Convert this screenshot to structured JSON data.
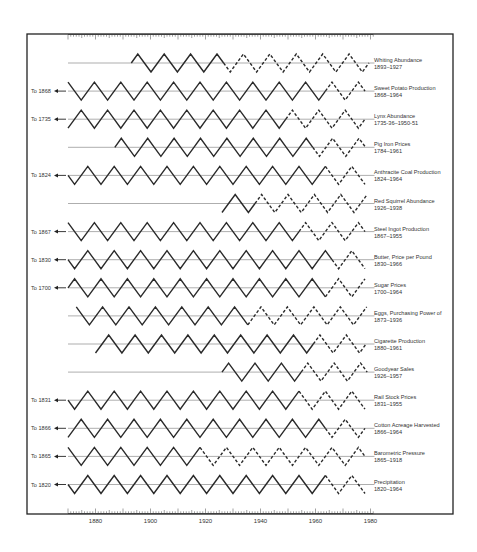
{
  "chart_data": {
    "type": "line",
    "title": "",
    "xlabel": "",
    "ylabel": "",
    "xlim": [
      1870,
      1981
    ],
    "x_ticks": [
      1880,
      1900,
      1920,
      1940,
      1960,
      1980
    ],
    "grid": false,
    "legend": "none (series labels at right of each row)",
    "style_note": "Idealized triangular cycles; solid = historical data, dashed = projected continuation",
    "series": [
      {
        "name": "Whiting Abundance",
        "range": "1893–1927",
        "left_note": "",
        "start": 1893,
        "end": 1927,
        "proj_end": 1980
      },
      {
        "name": "Sweet Potato Production",
        "range": "1868–1964",
        "left_note": "To 1868",
        "start": 1870,
        "end": 1964,
        "proj_end": 1980
      },
      {
        "name": "Lynx Abundance",
        "range": "1735-36–1950-51",
        "left_note": "To 1735",
        "start": 1870,
        "end": 1951,
        "proj_end": 1980
      },
      {
        "name": "Pig Iron Prices",
        "range": "1784–1961",
        "left_note": "",
        "start": 1887,
        "end": 1961,
        "proj_end": 1980
      },
      {
        "name": "Anthracite Coal Production",
        "range": "1824–1964",
        "left_note": "To 1824",
        "start": 1870,
        "end": 1964,
        "proj_end": 1980
      },
      {
        "name": "Red Squirrel Abundance",
        "range": "1926–1938",
        "left_note": "",
        "start": 1926,
        "end": 1938,
        "proj_end": 1980
      },
      {
        "name": "Steel Ingot Production",
        "range": "1867–1955",
        "left_note": "To 1867",
        "start": 1870,
        "end": 1955,
        "proj_end": 1980
      },
      {
        "name": "Butter, Price per Pound",
        "range": "1830–1966",
        "left_note": "To 1830",
        "start": 1870,
        "end": 1966,
        "proj_end": 1980
      },
      {
        "name": "Sugar Prices",
        "range": "1700–1964",
        "left_note": "To 1700",
        "start": 1870,
        "end": 1964,
        "proj_end": 1980
      },
      {
        "name": "Eggs, Purchasing Power of",
        "range": "1873–1936",
        "left_note": "",
        "start": 1873,
        "end": 1936,
        "proj_end": 1980
      },
      {
        "name": "Cigarette Production",
        "range": "1880–1961",
        "left_note": "",
        "start": 1880,
        "end": 1961,
        "proj_end": 1980
      },
      {
        "name": "Goodyear Sales",
        "range": "1926–1957",
        "left_note": "",
        "start": 1926,
        "end": 1957,
        "proj_end": 1980
      },
      {
        "name": "Rail Stock Prices",
        "range": "1831–1955",
        "left_note": "To 1831",
        "start": 1870,
        "end": 1955,
        "proj_end": 1980
      },
      {
        "name": "Cotton Acreage Harvested",
        "range": "1866–1964",
        "left_note": "To 1866",
        "start": 1870,
        "end": 1964,
        "proj_end": 1980
      },
      {
        "name": "Barometric Pressure",
        "range": "1865–1918",
        "left_note": "To 1865",
        "start": 1870,
        "end": 1918,
        "proj_end": 1980
      },
      {
        "name": "Precipitation",
        "range": "1820–1964",
        "left_note": "To 1820",
        "start": 1870,
        "end": 1964,
        "proj_end": 1980
      }
    ]
  },
  "layout": {
    "frame": {
      "x": 27,
      "y": 34,
      "w": 426,
      "h": 480
    },
    "axis_x0": 68,
    "axis_year0": 1870,
    "px_per_year": 2.75,
    "row_y0": 63,
    "row_step": 28.1,
    "amplitude": 9,
    "cycle_years": 9.6,
    "ink": "#2a2a2a",
    "baseline_color": "#777777"
  }
}
